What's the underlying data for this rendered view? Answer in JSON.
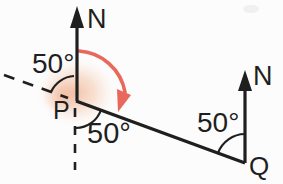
{
  "diagram": {
    "labels": {
      "north_p": "N",
      "north_q": "N",
      "point_p": "P",
      "point_q": "Q",
      "angle_nw_at_p": "50°",
      "angle_s_at_p": "50°",
      "angle_at_q": "50°"
    },
    "colors": {
      "line": "#1f1f1f",
      "text": "#1f1f1f",
      "rotation_arrow": "#e8685c",
      "highlight": "#f0b293",
      "background": "#fcfcfc"
    }
  }
}
